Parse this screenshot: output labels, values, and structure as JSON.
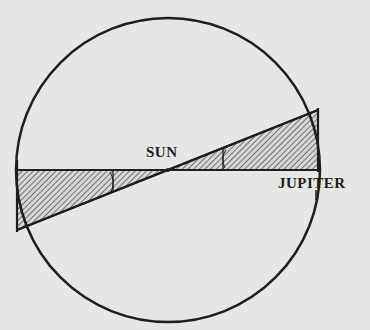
{
  "diagram": {
    "type": "orbit-parallax-diagram",
    "labels": {
      "sun": "SUN",
      "jupiter": "JUPITER"
    },
    "colors": {
      "background": "#e6e6e4",
      "ink": "#1e1e1e"
    },
    "elements": {
      "orbit": {
        "shape": "circle",
        "cx": 168,
        "cy": 170,
        "r": 152
      },
      "horizontal_line": {
        "x1": 17,
        "y1": 170,
        "x2": 318,
        "y2": 170
      },
      "slanted_line": {
        "x1": 17,
        "y1": 230,
        "x2": 318,
        "y2": 110
      },
      "left_triangle": {
        "points": "17,170 17,230 168,170",
        "fill": "hatched"
      },
      "right_triangle": {
        "points": "168,170 318,110 318,170",
        "fill": "hatched"
      }
    }
  }
}
